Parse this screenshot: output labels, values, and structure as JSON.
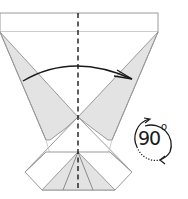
{
  "diagram": {
    "type": "origami-fold-step",
    "colors": {
      "paper": "#ffffff",
      "shade": "#e3e3e3",
      "edge": "#9a9a9a",
      "ink": "#1a1a1a"
    },
    "annotations": {
      "rotation_value": "90",
      "rotation_unit": "o"
    },
    "elements": [
      "top-band",
      "center-dashed-valley-line",
      "left-shaded-flap",
      "right-shaded-flap",
      "fold-over-arrow",
      "bottom-diamond-base",
      "rotate-90-symbol"
    ]
  }
}
